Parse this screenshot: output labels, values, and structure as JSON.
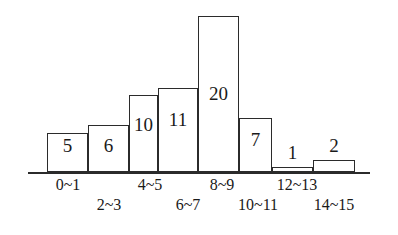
{
  "chart_data": {
    "type": "bar",
    "title": "",
    "xlabel": "",
    "ylabel": "",
    "grid": false,
    "legend": "none",
    "axis": {
      "baseline_shown": true,
      "y_axis_shown": false,
      "x_axis_shown": true
    },
    "categories": [
      "0~1",
      "2~3",
      "4~5",
      "6~7",
      "8~9",
      "10~11",
      "12~13",
      "14~15"
    ],
    "values": [
      5,
      6,
      10,
      11,
      20,
      7,
      1,
      2
    ],
    "value_labels": [
      "5",
      "6",
      "10",
      "11",
      "20",
      "7",
      "1",
      "2"
    ],
    "ylim": [
      0,
      20
    ],
    "bars": [
      {
        "category": "0~1",
        "value": 5,
        "label": "5",
        "x": 47,
        "w": 41,
        "h": 39,
        "label_top": 136,
        "label_inside": true
      },
      {
        "category": "2~3",
        "value": 6,
        "label": "6",
        "x": 88,
        "w": 41,
        "h": 47,
        "label_top": 136,
        "label_inside": true
      },
      {
        "category": "4~5",
        "value": 10,
        "label": "10",
        "x": 129,
        "w": 29,
        "h": 77,
        "label_top": 115,
        "label_inside": true
      },
      {
        "category": "6~7",
        "value": 11,
        "label": "11",
        "x": 158,
        "w": 40,
        "h": 84,
        "label_top": 110,
        "label_inside": true
      },
      {
        "category": "8~9",
        "value": 20,
        "label": "20",
        "x": 198,
        "w": 41,
        "h": 156,
        "label_top": 84,
        "label_inside": true
      },
      {
        "category": "10~11",
        "value": 7,
        "label": "7",
        "x": 239,
        "w": 33,
        "h": 54,
        "label_top": 130,
        "label_inside": true
      },
      {
        "category": "12~13",
        "value": 1,
        "label": "1",
        "x": 272,
        "w": 41,
        "h": 5,
        "label_top": 143,
        "label_inside": false
      },
      {
        "category": "14~15",
        "value": 2,
        "label": "2",
        "x": 313,
        "w": 42,
        "h": 12,
        "label_top": 136,
        "label_inside": false
      }
    ],
    "tick_labels": [
      {
        "text": "0~1",
        "center": 68,
        "row": "a"
      },
      {
        "text": "2~3",
        "center": 109,
        "row": "b"
      },
      {
        "text": "4~5",
        "center": 150,
        "row": "a"
      },
      {
        "text": "6~7",
        "center": 188,
        "row": "b"
      },
      {
        "text": "8~9",
        "center": 222,
        "row": "a"
      },
      {
        "text": "10~11",
        "center": 258,
        "row": "b"
      },
      {
        "text": "12~13",
        "center": 297,
        "row": "a"
      },
      {
        "text": "14~15",
        "center": 334,
        "row": "b"
      }
    ]
  },
  "colors": {
    "ink": "#2b2b2b",
    "background": "#ffffff",
    "bar_fill": "#ffffff"
  }
}
